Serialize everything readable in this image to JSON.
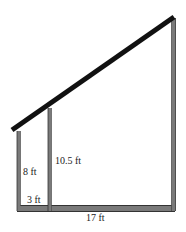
{
  "diagram": {
    "type": "shed-frame",
    "labels": {
      "short_post_height": "8 ft",
      "middle_post_height": "10.5 ft",
      "short_span": "3 ft",
      "total_span": "17 ft"
    },
    "colors": {
      "roof": "#111111",
      "post": "#6e6e6e",
      "post_edge": "#3a3a3a",
      "text": "#222222",
      "background": "#ffffff"
    }
  }
}
